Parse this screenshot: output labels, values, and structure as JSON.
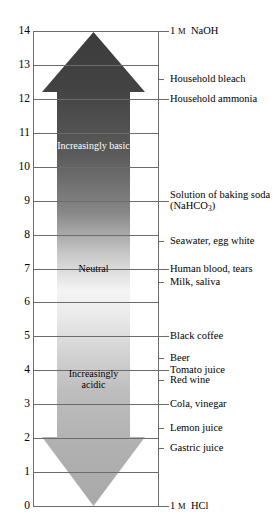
{
  "figure": {
    "axis": {
      "label": "pH",
      "min": 0,
      "max": 14,
      "tick_step": 1,
      "tick_labels": [
        "14",
        "13",
        "12",
        "11",
        "10",
        "9",
        "8",
        "7",
        "6",
        "5",
        "4",
        "3",
        "2",
        "1",
        "0"
      ]
    },
    "arrow": {
      "direction": "double",
      "top_cap_label": "basic",
      "bottom_cap_label": "acidic",
      "colors": {
        "basic_dark": "#3f3f3f",
        "neutral_light": "#f2f2f2",
        "acidic_mid": "#a9a9a9"
      }
    },
    "captions": [
      {
        "text": "Increasingly basic",
        "ph": 10.6,
        "tone": "on-dark"
      },
      {
        "text": "Neutral",
        "ph": 7.0,
        "tone": "on-light"
      },
      {
        "text": "Increasingly acidic",
        "ph": 3.75,
        "tone": "on-light"
      }
    ],
    "substances": [
      {
        "name": "1 M NaOH",
        "ph": 14.0,
        "tick": "long",
        "smallcaps_m": true
      },
      {
        "name": "Household bleach",
        "ph": 12.6,
        "tick": "short",
        "smallcaps_m": false
      },
      {
        "name": "Household ammonia",
        "ph": 12.0,
        "tick": "long",
        "smallcaps_m": false
      },
      {
        "name": "Solution of baking soda (NaHCO3)",
        "ph": 9.0,
        "tick": "long",
        "smallcaps_m": false,
        "two_line": true
      },
      {
        "name": "Seawater, egg white",
        "ph": 7.8,
        "tick": "short",
        "smallcaps_m": false
      },
      {
        "name": "Human blood, tears",
        "ph": 7.0,
        "tick": "long",
        "smallcaps_m": false
      },
      {
        "name": "Milk, saliva",
        "ph": 6.6,
        "tick": "short",
        "smallcaps_m": false
      },
      {
        "name": "Black coffee",
        "ph": 5.0,
        "tick": "long",
        "smallcaps_m": false
      },
      {
        "name": "Beer",
        "ph": 4.35,
        "tick": "short",
        "smallcaps_m": false
      },
      {
        "name": "Tomato juice",
        "ph": 4.0,
        "tick": "long",
        "smallcaps_m": false
      },
      {
        "name": "Red wine",
        "ph": 3.7,
        "tick": "short",
        "smallcaps_m": false
      },
      {
        "name": "Cola, vinegar",
        "ph": 3.0,
        "tick": "long",
        "smallcaps_m": false
      },
      {
        "name": "Lemon juice",
        "ph": 2.3,
        "tick": "short",
        "smallcaps_m": false
      },
      {
        "name": "Gastric juice",
        "ph": 1.7,
        "tick": "short",
        "smallcaps_m": false
      },
      {
        "name": "1 M HCl",
        "ph": 0.0,
        "tick": "long",
        "smallcaps_m": true
      }
    ]
  },
  "chart_data": {
    "type": "bar",
    "xlabel": "",
    "ylabel": "pH",
    "ylim": [
      0,
      14
    ],
    "grid": true,
    "legend": "none",
    "categories": [
      "1 M NaOH",
      "Household bleach",
      "Household ammonia",
      "Solution of baking soda (NaHCO3)",
      "Seawater, egg white",
      "Human blood, tears",
      "Milk, saliva",
      "Black coffee",
      "Beer",
      "Tomato juice",
      "Red wine",
      "Cola, vinegar",
      "Lemon juice",
      "Gastric juice",
      "1 M HCl"
    ],
    "values": [
      14.0,
      12.6,
      12.0,
      9.0,
      7.8,
      7.0,
      6.6,
      5.0,
      4.35,
      4.0,
      3.7,
      3.0,
      2.3,
      1.7,
      0.0
    ],
    "tick_labels": [
      "0",
      "1",
      "2",
      "3",
      "4",
      "5",
      "6",
      "7",
      "8",
      "9",
      "10",
      "11",
      "12",
      "13",
      "14"
    ],
    "annotations": [
      {
        "text": "Increasingly basic",
        "value": 10.6
      },
      {
        "text": "Neutral",
        "value": 7.0
      },
      {
        "text": "Increasingly acidic",
        "value": 3.75
      }
    ]
  }
}
